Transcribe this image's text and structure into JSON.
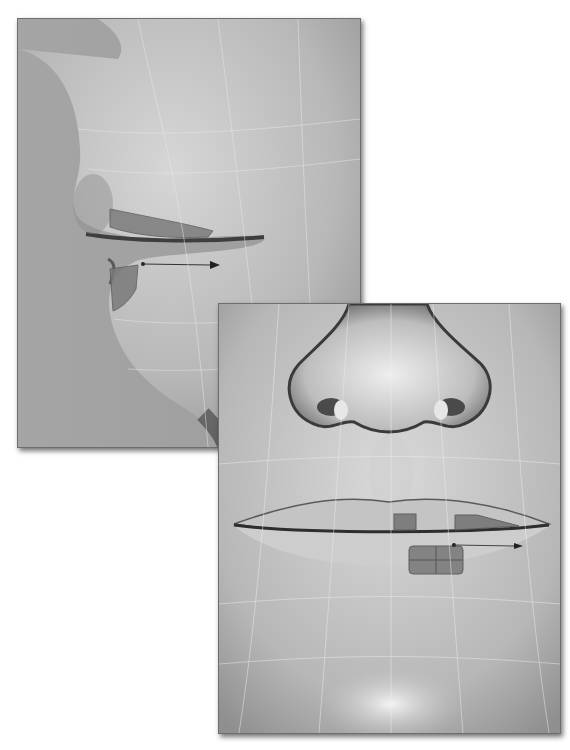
{
  "scene": {
    "description": "Two 3D modeling viewport renders of a face mesh",
    "panels": [
      {
        "id": "side",
        "view": "side profile of nose and lips",
        "selected_faces": 2,
        "move_arrow": true
      },
      {
        "id": "front",
        "view": "front view of nose and lips",
        "selected_faces": 3,
        "move_arrow": true
      }
    ],
    "colors": {
      "background": "#ffffff",
      "surface_light": "#d8d8d8",
      "surface_mid": "#a9a9a9",
      "surface_dark": "#4a4a4a",
      "selection": "#7a7a7a",
      "wire": "#e6e6e6"
    }
  }
}
